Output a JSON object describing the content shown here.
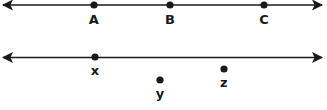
{
  "figure": {
    "width": 327,
    "height": 110,
    "background_color": "#ffffff",
    "stroke_color": "#1a1a1a",
    "line_width": 1.6,
    "dot_radius": 3.6,
    "lines": [
      {
        "name": "line-top",
        "y": 5,
        "x_start": 3,
        "x_end": 322,
        "arrow_start": true,
        "arrow_end": true
      },
      {
        "name": "line-bottom",
        "y": 57.5,
        "x_start": 3,
        "x_end": 322,
        "arrow_start": true,
        "arrow_end": true
      }
    ],
    "points": [
      {
        "id": "A",
        "label": "A",
        "cx": 94,
        "cy": 5,
        "label_x": 94,
        "label_y": 13,
        "on_line": "line-top"
      },
      {
        "id": "B",
        "label": "B",
        "cx": 170,
        "cy": 5,
        "label_x": 170,
        "label_y": 13,
        "on_line": "line-top"
      },
      {
        "id": "C",
        "label": "C",
        "cx": 264,
        "cy": 5,
        "label_x": 264,
        "label_y": 13,
        "on_line": "line-top"
      },
      {
        "id": "X",
        "label": "x",
        "cx": 95,
        "cy": 57,
        "label_x": 95,
        "label_y": 64,
        "on_line": "line-bottom"
      },
      {
        "id": "Y",
        "label": "y",
        "cx": 160,
        "cy": 80,
        "label_x": 160,
        "label_y": 87,
        "on_line": null
      },
      {
        "id": "Z",
        "label": "z",
        "cx": 224,
        "cy": 69,
        "label_x": 224,
        "label_y": 76,
        "on_line": null
      }
    ]
  }
}
